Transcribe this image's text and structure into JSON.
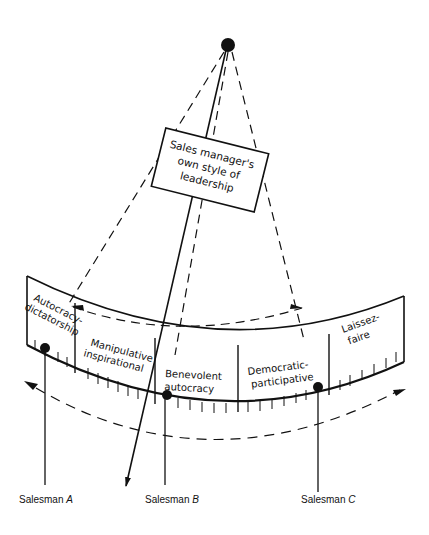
{
  "diagram": {
    "type": "leadership-style-continuum",
    "center_box": {
      "lines": [
        "Sales manager's",
        "own style of",
        "leadership"
      ]
    },
    "scale_segments": [
      {
        "lines": [
          "Autocracy-",
          "dictatorship"
        ]
      },
      {
        "lines": [
          "Manipulative",
          "inspirational"
        ]
      },
      {
        "lines": [
          "Benevolent",
          "autocracy"
        ]
      },
      {
        "lines": [
          "Democratic-",
          "participative"
        ]
      },
      {
        "lines": [
          "Laissez-",
          "faire"
        ]
      }
    ],
    "salesmen": [
      {
        "name": "Salesman",
        "letter": "A"
      },
      {
        "name": "Salesman",
        "letter": "B"
      },
      {
        "name": "Salesman",
        "letter": "C"
      }
    ],
    "colors": {
      "ink": "#111111",
      "background": "#ffffff"
    }
  }
}
